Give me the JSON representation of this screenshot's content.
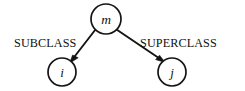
{
  "figure": {
    "type": "directed-graph-diagram",
    "background_color": "#ffffff",
    "ink_color": "#141414",
    "width": 245,
    "height": 91
  },
  "nodes": [
    {
      "id": "m",
      "label": "m",
      "role": "root",
      "cx": 106,
      "cy": 19,
      "r": 15
    },
    {
      "id": "i",
      "label": "i",
      "role": "subclass-target",
      "cx": 62,
      "cy": 72,
      "r": 14
    },
    {
      "id": "j",
      "label": "j",
      "role": "superclass-target",
      "cx": 172,
      "cy": 72,
      "r": 14
    }
  ],
  "edges": [
    {
      "id": "edge-subclass",
      "label": "SUBCLASS",
      "from": "m",
      "to": "i",
      "direction": "down-left",
      "label_x": 14,
      "label_y": 47
    },
    {
      "id": "edge-superclass",
      "label": "SUPERCLASS",
      "from": "m",
      "to": "j",
      "direction": "down-right",
      "label_x": 140,
      "label_y": 47
    }
  ]
}
